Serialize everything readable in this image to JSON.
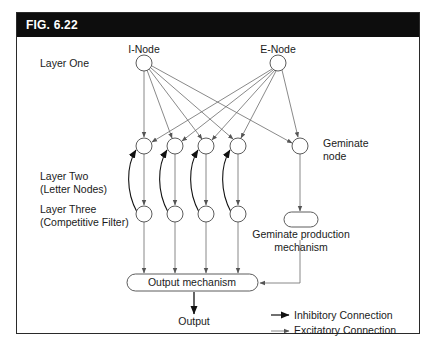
{
  "figure": {
    "title": "FIG. 6.22"
  },
  "layers": {
    "one": "Layer One",
    "two_line1": "Layer Two",
    "two_line2": "(Letter Nodes)",
    "three_line1": "Layer Three",
    "three_line2": "(Competitive Filter)"
  },
  "nodes": {
    "i_node": "I-Node",
    "e_node": "E-Node",
    "geminate_line1": "Geminate",
    "geminate_line2": "node",
    "geminate_prod_line1": "Geminate production",
    "geminate_prod_line2": "mechanism",
    "output_mechanism": "Output mechanism",
    "output": "Output"
  },
  "legend": {
    "inhibitory": "Inhibitory Connection",
    "excitatory": "Excitatory Connection"
  },
  "colors": {
    "header_bg": "#0d0d0d",
    "line": "#6b6b6b",
    "inhibitory": "#111111"
  }
}
